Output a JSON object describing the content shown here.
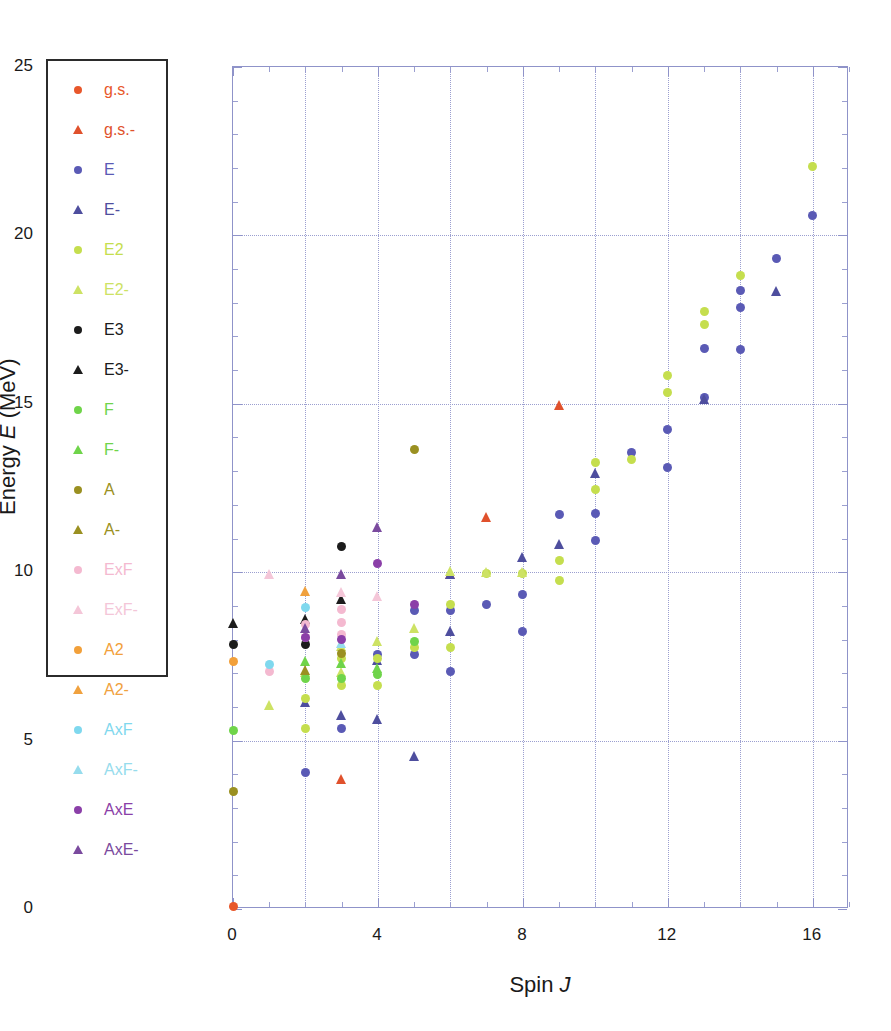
{
  "axes": {
    "y_title_prefix": "Energy ",
    "y_title_var": "E",
    "y_title_suffix": " (MeV)",
    "x_title_prefix": "Spin ",
    "x_title_var": "J",
    "y_ticks": [
      "0",
      "5",
      "10",
      "15",
      "20",
      "25"
    ],
    "x_ticks": [
      "0",
      "4",
      "8",
      "12",
      "16"
    ]
  },
  "legend": {
    "items": [
      {
        "label": "g.s.",
        "shape": "circle",
        "color": "#e8572b"
      },
      {
        "label": "g.s.-",
        "shape": "triangle",
        "color": "#e0512c"
      },
      {
        "label": "E",
        "shape": "circle",
        "color": "#5a5ab5"
      },
      {
        "label": "E-",
        "shape": "triangle",
        "color": "#4e4e9e"
      },
      {
        "label": "E2",
        "shape": "circle",
        "color": "#c5de4e"
      },
      {
        "label": "E2-",
        "shape": "triangle",
        "color": "#cde264"
      },
      {
        "label": "E3",
        "shape": "circle",
        "color": "#1c1c1c"
      },
      {
        "label": "E3-",
        "shape": "triangle",
        "color": "#1c1c1c"
      },
      {
        "label": "F",
        "shape": "circle",
        "color": "#6fd44a"
      },
      {
        "label": "F-",
        "shape": "triangle",
        "color": "#6fd44a"
      },
      {
        "label": "A",
        "shape": "circle",
        "color": "#9a9021"
      },
      {
        "label": "A-",
        "shape": "triangle",
        "color": "#9a9021"
      },
      {
        "label": "ExF",
        "shape": "circle",
        "color": "#f4b9d0"
      },
      {
        "label": "ExF-",
        "shape": "triangle",
        "color": "#f4c6d8"
      },
      {
        "label": "A2",
        "shape": "circle",
        "color": "#f2a03a"
      },
      {
        "label": "A2-",
        "shape": "triangle",
        "color": "#f0a13e"
      },
      {
        "label": "AxF",
        "shape": "circle",
        "color": "#7fd8ee"
      },
      {
        "label": "AxF-",
        "shape": "triangle",
        "color": "#96dced"
      },
      {
        "label": "AxE",
        "shape": "circle",
        "color": "#8b3fa8"
      },
      {
        "label": "AxE-",
        "shape": "triangle",
        "color": "#7a4a9e"
      }
    ]
  },
  "chart_data": {
    "type": "scatter",
    "title": "",
    "xlabel": "Spin J",
    "ylabel": "Energy E (MeV)",
    "xlim": [
      0,
      17
    ],
    "ylim": [
      0,
      25
    ],
    "x_major_step": 4,
    "x_grid_step": 2,
    "y_major_step": 5,
    "y_minor_step": 1,
    "grid": true,
    "legend_position": "left-outside",
    "series": [
      {
        "name": "g.s.",
        "shape": "circle",
        "color": "#e8572b",
        "points": [
          [
            0,
            0.08
          ]
        ]
      },
      {
        "name": "g.s.-",
        "shape": "triangle",
        "color": "#e0512c",
        "points": [
          [
            3,
            3.85
          ],
          [
            6,
            9.95
          ],
          [
            7,
            11.65
          ],
          [
            9,
            14.95
          ]
        ]
      },
      {
        "name": "E",
        "shape": "circle",
        "color": "#5a5ab5",
        "points": [
          [
            2,
            4.05
          ],
          [
            3,
            5.35
          ],
          [
            4,
            7.55
          ],
          [
            5,
            7.55
          ],
          [
            5,
            8.85
          ],
          [
            6,
            7.05
          ],
          [
            6,
            8.85
          ],
          [
            7,
            9.05
          ],
          [
            8,
            8.25
          ],
          [
            8,
            9.35
          ],
          [
            9,
            11.7
          ],
          [
            10,
            10.95
          ],
          [
            10,
            11.75
          ],
          [
            11,
            13.55
          ],
          [
            12,
            13.1
          ],
          [
            12,
            14.25
          ],
          [
            13,
            15.2
          ],
          [
            13,
            16.65
          ],
          [
            14,
            16.6
          ],
          [
            14,
            17.85
          ],
          [
            14,
            18.35
          ],
          [
            15,
            19.3
          ],
          [
            16,
            20.6
          ]
        ]
      },
      {
        "name": "E-",
        "shape": "triangle",
        "color": "#4e4e9e",
        "points": [
          [
            2,
            6.15
          ],
          [
            3,
            5.75
          ],
          [
            4,
            5.65
          ],
          [
            4,
            7.4
          ],
          [
            5,
            4.55
          ],
          [
            6,
            8.25
          ],
          [
            6,
            9.95
          ],
          [
            8,
            10.45
          ],
          [
            9,
            10.85
          ],
          [
            10,
            12.95
          ],
          [
            13,
            15.15
          ],
          [
            15,
            18.35
          ]
        ]
      },
      {
        "name": "E2",
        "shape": "circle",
        "color": "#c5de4e",
        "points": [
          [
            2,
            5.35
          ],
          [
            2,
            6.25
          ],
          [
            3,
            6.65
          ],
          [
            3,
            7.45
          ],
          [
            4,
            6.65
          ],
          [
            4,
            7.45
          ],
          [
            5,
            7.75
          ],
          [
            6,
            7.75
          ],
          [
            6,
            9.05
          ],
          [
            7,
            9.95
          ],
          [
            8,
            9.95
          ],
          [
            9,
            9.75
          ],
          [
            9,
            10.35
          ],
          [
            10,
            12.45
          ],
          [
            10,
            13.25
          ],
          [
            11,
            13.35
          ],
          [
            12,
            15.35
          ],
          [
            12,
            15.85
          ],
          [
            13,
            17.35
          ],
          [
            13,
            17.75
          ],
          [
            14,
            18.8
          ],
          [
            16,
            22.05
          ]
        ]
      },
      {
        "name": "E2-",
        "shape": "triangle",
        "color": "#cde264",
        "points": [
          [
            1,
            6.05
          ],
          [
            2,
            7.05
          ],
          [
            3,
            7.05
          ],
          [
            3,
            7.8
          ],
          [
            4,
            7.95
          ],
          [
            5,
            8.35
          ],
          [
            6,
            10.05
          ],
          [
            7,
            10.0
          ],
          [
            8,
            10.0
          ]
        ]
      },
      {
        "name": "E3",
        "shape": "circle",
        "color": "#1c1c1c",
        "points": [
          [
            0,
            7.85
          ],
          [
            2,
            7.85
          ],
          [
            3,
            10.75
          ]
        ]
      },
      {
        "name": "E3-",
        "shape": "triangle",
        "color": "#1c1c1c",
        "points": [
          [
            0,
            8.5
          ],
          [
            2,
            8.6
          ],
          [
            3,
            9.2
          ]
        ]
      },
      {
        "name": "F",
        "shape": "circle",
        "color": "#6fd44a",
        "points": [
          [
            0,
            5.3
          ],
          [
            2,
            6.85
          ],
          [
            3,
            6.85
          ],
          [
            4,
            6.95
          ],
          [
            5,
            7.95
          ]
        ]
      },
      {
        "name": "F-",
        "shape": "triangle",
        "color": "#6fd44a",
        "points": [
          [
            2,
            7.35
          ],
          [
            3,
            7.3
          ],
          [
            4,
            7.15
          ]
        ]
      },
      {
        "name": "A",
        "shape": "circle",
        "color": "#9a9021",
        "points": [
          [
            0,
            3.5
          ],
          [
            3,
            7.6
          ],
          [
            5,
            13.65
          ]
        ]
      },
      {
        "name": "A-",
        "shape": "triangle",
        "color": "#9a9021",
        "points": [
          [
            2,
            7.1
          ]
        ]
      },
      {
        "name": "ExF",
        "shape": "circle",
        "color": "#f4b9d0",
        "points": [
          [
            1,
            7.05
          ],
          [
            2,
            8.05
          ],
          [
            2,
            8.45
          ],
          [
            3,
            8.15
          ],
          [
            3,
            8.5
          ],
          [
            3,
            8.9
          ]
        ]
      },
      {
        "name": "ExF-",
        "shape": "triangle",
        "color": "#f4c6d8",
        "points": [
          [
            1,
            9.95
          ],
          [
            3,
            9.4
          ],
          [
            4,
            9.3
          ]
        ]
      },
      {
        "name": "A2",
        "shape": "circle",
        "color": "#f2a03a",
        "points": [
          [
            0,
            7.35
          ]
        ]
      },
      {
        "name": "A2-",
        "shape": "triangle",
        "color": "#f0a13e",
        "points": [
          [
            2,
            9.45
          ]
        ]
      },
      {
        "name": "AxF",
        "shape": "circle",
        "color": "#7fd8ee",
        "points": [
          [
            1,
            7.25
          ],
          [
            2,
            8.95
          ]
        ]
      },
      {
        "name": "AxF-",
        "shape": "triangle",
        "color": "#96dced",
        "points": [
          [
            3,
            7.9
          ]
        ]
      },
      {
        "name": "AxE",
        "shape": "circle",
        "color": "#8b3fa8",
        "points": [
          [
            2,
            8.05
          ],
          [
            3,
            8.0
          ],
          [
            4,
            10.25
          ],
          [
            5,
            9.05
          ]
        ]
      },
      {
        "name": "AxE-",
        "shape": "triangle",
        "color": "#7a4a9e",
        "points": [
          [
            2,
            8.35
          ],
          [
            3,
            9.95
          ],
          [
            4,
            11.35
          ]
        ]
      }
    ]
  }
}
